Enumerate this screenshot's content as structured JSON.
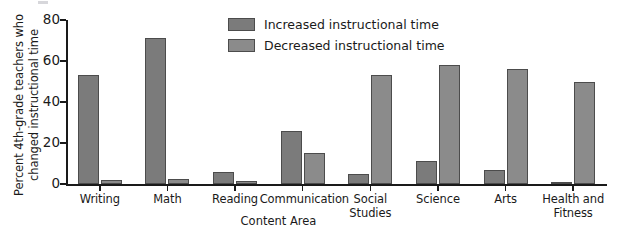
{
  "chart_data": {
    "type": "bar",
    "title": "",
    "subtitle": "",
    "xlabel": "Content Area",
    "ylabel": "Percent 4th-grade teachers who changed instructional time",
    "ylabel_lines": [
      "Percent 4th-grade teachers who",
      "changed instructional time"
    ],
    "ylim": [
      0,
      80
    ],
    "yticks": [
      0,
      20,
      40,
      60,
      80
    ],
    "ytick_labels": [
      "0",
      "20",
      "40",
      "60",
      "80"
    ],
    "grid": false,
    "legend_position": "top-center",
    "categories": [
      "Writing",
      "Math",
      "Reading",
      "Communication",
      "Social Studies",
      "Science",
      "Arts",
      "Health and Fitness"
    ],
    "category_label_lines": [
      [
        "Writing"
      ],
      [
        "Math"
      ],
      [
        "Reading"
      ],
      [
        "Communication"
      ],
      [
        "Social",
        "Studies"
      ],
      [
        "Science"
      ],
      [
        "Arts"
      ],
      [
        "Health and",
        "Fitness"
      ]
    ],
    "series": [
      {
        "name": "Increased instructional time",
        "color": "#7b7b7b",
        "values": [
          53,
          71,
          6,
          26,
          5,
          11,
          7,
          1
        ]
      },
      {
        "name": "Decreased instructional time",
        "color": "#8b8b8b",
        "values": [
          2,
          2.5,
          1.5,
          15,
          53,
          58,
          56,
          50
        ]
      }
    ],
    "axis_color": "#1a1a1a",
    "bar_border_color": "#4c4c4c",
    "background": "#ffffff"
  },
  "legend": {
    "items": [
      {
        "label": "Increased instructional time",
        "swatch": "increased"
      },
      {
        "label": "Decreased instructional time",
        "swatch": "decreased"
      }
    ]
  }
}
